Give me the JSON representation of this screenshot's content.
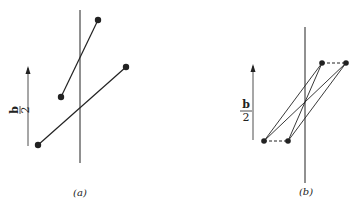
{
  "figure": {
    "panels": [
      {
        "id": "a",
        "caption": "(a)",
        "arrow_label_numerator": "b",
        "arrow_label_denominator": "2",
        "axis": {
          "x": 80,
          "y1": 10,
          "y2": 163
        },
        "arrow": {
          "x": 28,
          "y_bottom": 146,
          "y_top": 68
        },
        "segments": [
          {
            "name": "upper-segment",
            "x1": 98,
            "y1": 20,
            "x2": 61,
            "y2": 97
          },
          {
            "name": "lower-segment",
            "x1": 38,
            "y1": 145,
            "x2": 126,
            "y2": 67
          }
        ]
      },
      {
        "id": "b",
        "caption": "(b)",
        "arrow_label_numerator": "b",
        "arrow_label_denominator": "2",
        "axis": {
          "x": 305,
          "y1": 27,
          "y2": 183
        },
        "arrow": {
          "x": 253,
          "y_bottom": 140,
          "y_top": 64
        },
        "points": [
          {
            "name": "top-left",
            "x": 322,
            "y": 63
          },
          {
            "name": "top-right",
            "x": 346,
            "y": 63
          },
          {
            "name": "bottom-left",
            "x": 264,
            "y": 141
          },
          {
            "name": "bottom-right",
            "x": 288,
            "y": 141
          }
        ],
        "solid_links": [
          [
            264,
            141,
            322,
            63
          ],
          [
            264,
            141,
            346,
            63
          ],
          [
            288,
            141,
            322,
            63
          ],
          [
            288,
            141,
            346,
            63
          ]
        ],
        "dashed_links": [
          [
            322,
            63,
            346,
            63
          ],
          [
            264,
            141,
            288,
            141
          ]
        ]
      }
    ],
    "colors": {
      "ink": "#222222",
      "background": "#ffffff"
    }
  }
}
